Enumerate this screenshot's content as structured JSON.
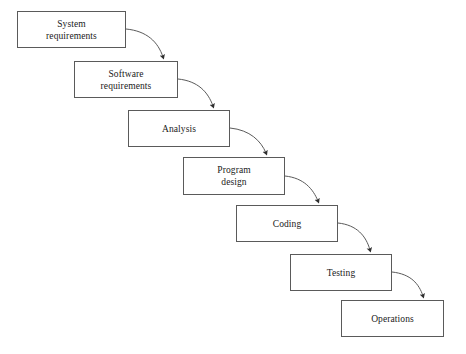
{
  "diagram": {
    "type": "flowchart",
    "background_color": "#ffffff",
    "box_border_color": "#5a5a5a",
    "box_fill_color": "#ffffff",
    "text_color": "#1a1a1a",
    "arrow_color": "#3a3a3a",
    "phases": [
      {
        "id": "system-requirements",
        "label": "System\nrequirements",
        "x": 17,
        "y": 11,
        "width": 109,
        "height": 37
      },
      {
        "id": "software-requirements",
        "label": "Software\nrequirements",
        "x": 74,
        "y": 61,
        "width": 104,
        "height": 37
      },
      {
        "id": "analysis",
        "label": "Analysis",
        "x": 128,
        "y": 110,
        "width": 102,
        "height": 37
      },
      {
        "id": "program-design",
        "label": "Program\ndesign",
        "x": 183,
        "y": 157,
        "width": 102,
        "height": 38
      },
      {
        "id": "coding",
        "label": "Coding",
        "x": 236,
        "y": 205,
        "width": 102,
        "height": 37
      },
      {
        "id": "testing",
        "label": "Testing",
        "x": 290,
        "y": 254,
        "width": 102,
        "height": 37
      },
      {
        "id": "operations",
        "label": "Operations",
        "x": 341,
        "y": 300,
        "width": 103,
        "height": 37
      }
    ],
    "connectors": [
      {
        "id": "arrow-system-to-software",
        "from": "system-requirements",
        "to": "software-requirements"
      },
      {
        "id": "arrow-software-to-analysis",
        "from": "software-requirements",
        "to": "analysis"
      },
      {
        "id": "arrow-analysis-to-program-design",
        "from": "analysis",
        "to": "program-design"
      },
      {
        "id": "arrow-program-design-to-coding",
        "from": "program-design",
        "to": "coding"
      },
      {
        "id": "arrow-coding-to-testing",
        "from": "coding",
        "to": "testing"
      },
      {
        "id": "arrow-testing-to-operations",
        "from": "testing",
        "to": "operations"
      }
    ]
  }
}
